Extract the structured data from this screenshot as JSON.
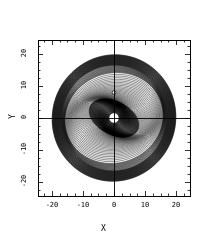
{
  "figure": {
    "title": "CLOSED GAS ORBITS",
    "background_color": "#ffffff",
    "ink_color": "#000000",
    "width": 207,
    "height": 249
  },
  "axes": {
    "xlabel": "X",
    "ylabel": "Y",
    "x_tick_labels": [
      "-20",
      "-10",
      "0",
      "10",
      "20"
    ],
    "y_tick_labels": [
      "20",
      "10",
      "0",
      "-10",
      "-20"
    ],
    "x_tick_values": [
      -20,
      -10,
      0,
      10,
      20
    ],
    "y_tick_values": [
      20,
      10,
      0,
      -10,
      -20
    ],
    "minor_tick_step": 2.5,
    "frame": {
      "left": 38,
      "top": 40,
      "right": 190,
      "bottom": 196
    }
  },
  "chart_data": {
    "type": "line",
    "title": "CLOSED GAS ORBITS",
    "xlabel": "X",
    "ylabel": "Y",
    "xlim": [
      -24.5,
      24.5
    ],
    "ylim": [
      -24.5,
      24.5
    ],
    "grid": false,
    "legend": null,
    "center": {
      "x": 0,
      "y": 0
    },
    "marker_point": {
      "x": 0,
      "y": 8,
      "symbol": "circle"
    },
    "central_hole_radius": 1.4,
    "orbit_count": 160,
    "orbit_family": {
      "r_min": 1.6,
      "r_max": 20.2,
      "ellipticity_min": 0.02,
      "ellipticity_max": 0.34,
      "position_angle_min_deg": -62,
      "position_angle_max_deg": 40,
      "gap_inner_radius": 10.8,
      "gap_outer_radius": 14.0
    },
    "series": [
      {
        "name": "inner orbits",
        "r_range": [
          1.6,
          10.8
        ],
        "count": 62
      },
      {
        "name": "gap orbits",
        "r_range": [
          10.8,
          14.0
        ],
        "count": 18
      },
      {
        "name": "outer orbits",
        "r_range": [
          14.0,
          20.2
        ],
        "count": 80
      }
    ]
  }
}
